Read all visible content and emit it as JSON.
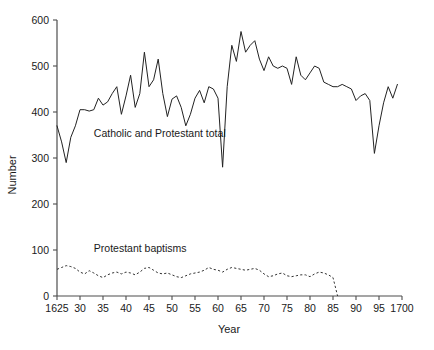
{
  "chart_data": {
    "type": "line",
    "title": "",
    "xlabel": "Year",
    "ylabel": "Number",
    "xlim": [
      1625,
      1700
    ],
    "ylim": [
      0,
      600
    ],
    "grid": false,
    "legend_position": "inline-annotation",
    "x_ticks": [
      1625,
      1630,
      1635,
      1640,
      1645,
      1650,
      1655,
      1660,
      1665,
      1670,
      1675,
      1680,
      1685,
      1690,
      1695,
      1700
    ],
    "x_tick_labels": [
      "1625",
      "30",
      "35",
      "40",
      "45",
      "50",
      "55",
      "60",
      "65",
      "70",
      "75",
      "80",
      "85",
      "90",
      "95",
      "1700"
    ],
    "y_ticks": [
      0,
      100,
      200,
      300,
      400,
      500,
      600
    ],
    "y_tick_labels": [
      "0",
      "100",
      "200",
      "300",
      "400",
      "500",
      "600"
    ],
    "annotations": [
      {
        "text": "Catholic and Protestant total",
        "x": 1633,
        "y": 345
      },
      {
        "text": "Protestant baptisms",
        "x": 1633,
        "y": 95
      }
    ],
    "series": [
      {
        "name": "Catholic and Protestant total",
        "style": "solid",
        "color": "#222222",
        "x": [
          1625,
          1626,
          1627,
          1628,
          1629,
          1630,
          1631,
          1632,
          1633,
          1634,
          1635,
          1636,
          1637,
          1638,
          1639,
          1640,
          1641,
          1642,
          1643,
          1644,
          1645,
          1646,
          1647,
          1648,
          1649,
          1650,
          1651,
          1652,
          1653,
          1654,
          1655,
          1656,
          1657,
          1658,
          1659,
          1660,
          1661,
          1662,
          1663,
          1664,
          1665,
          1666,
          1667,
          1668,
          1669,
          1670,
          1671,
          1672,
          1673,
          1674,
          1675,
          1676,
          1677,
          1678,
          1679,
          1680,
          1681,
          1682,
          1683,
          1684,
          1685,
          1686,
          1687,
          1688,
          1689,
          1690,
          1691,
          1692,
          1693,
          1694,
          1695,
          1696,
          1697,
          1698,
          1699
        ],
        "y": [
          370,
          335,
          290,
          345,
          370,
          405,
          405,
          402,
          405,
          430,
          415,
          422,
          440,
          455,
          395,
          435,
          480,
          410,
          440,
          530,
          455,
          470,
          515,
          440,
          390,
          428,
          435,
          410,
          370,
          395,
          430,
          447,
          420,
          455,
          450,
          430,
          280,
          455,
          545,
          510,
          575,
          530,
          545,
          555,
          515,
          490,
          520,
          500,
          495,
          500,
          495,
          460,
          520,
          480,
          470,
          485,
          500,
          495,
          465,
          460,
          455,
          455,
          460,
          455,
          450,
          425,
          435,
          440,
          425,
          310,
          370,
          420,
          455,
          430,
          460
        ]
      },
      {
        "name": "Protestant baptisms",
        "style": "dotted",
        "color": "#333333",
        "x": [
          1625,
          1626,
          1627,
          1628,
          1629,
          1630,
          1631,
          1632,
          1633,
          1634,
          1635,
          1636,
          1637,
          1638,
          1639,
          1640,
          1641,
          1642,
          1643,
          1644,
          1645,
          1646,
          1647,
          1648,
          1649,
          1650,
          1651,
          1652,
          1653,
          1654,
          1655,
          1656,
          1657,
          1658,
          1659,
          1660,
          1661,
          1662,
          1663,
          1664,
          1665,
          1666,
          1667,
          1668,
          1669,
          1670,
          1671,
          1672,
          1673,
          1674,
          1675,
          1676,
          1677,
          1678,
          1679,
          1680,
          1681,
          1682,
          1683,
          1684,
          1685,
          1686
        ],
        "y": [
          58,
          62,
          66,
          64,
          60,
          52,
          48,
          55,
          50,
          44,
          40,
          46,
          50,
          52,
          48,
          52,
          50,
          46,
          52,
          60,
          62,
          56,
          50,
          48,
          50,
          46,
          42,
          40,
          44,
          48,
          50,
          52,
          56,
          62,
          58,
          56,
          52,
          58,
          62,
          60,
          58,
          56,
          58,
          60,
          56,
          48,
          42,
          44,
          48,
          50,
          44,
          42,
          44,
          46,
          46,
          42,
          48,
          52,
          50,
          46,
          40,
          0
        ]
      }
    ]
  }
}
